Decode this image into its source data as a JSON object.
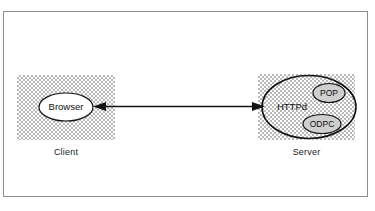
{
  "figure": {
    "background_color": "#ffffff",
    "frame_border_color": "#8d8d8d",
    "stroke_color": "#141414",
    "zone_fill_pattern": "dithered-grey-checker",
    "zone_fill_color": "#b9b9b9"
  },
  "client": {
    "caption": "Client",
    "node": {
      "label": "Browser",
      "shape": "ellipse"
    }
  },
  "server": {
    "caption": "Server",
    "node": {
      "label": "HTTPd",
      "shape": "ellipse"
    },
    "components": [
      {
        "label": "POP",
        "shape": "ellipse"
      },
      {
        "label": "ODPC",
        "shape": "ellipse"
      }
    ]
  },
  "connector": {
    "type": "double-headed-arrow",
    "from": "Browser",
    "to": "HTTPd",
    "label": ""
  }
}
